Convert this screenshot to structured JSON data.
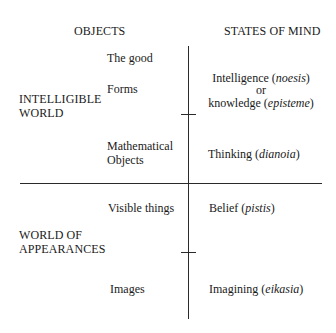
{
  "headers": {
    "objects": "OBJECTS",
    "states_of_mind": "STATES OF MIND"
  },
  "realms": {
    "intelligible": [
      "INTELLIGIBLE",
      "WORLD"
    ],
    "appearances": [
      "WORLD OF",
      "APPEARANCES"
    ]
  },
  "objects": {
    "the_good": "The good",
    "forms": "Forms",
    "mathematical": [
      "Mathematical",
      "Objects"
    ],
    "visible_things": "Visible things",
    "images": "Images"
  },
  "states": {
    "intelligence": {
      "term": "Intelligence (",
      "greek": "noesis",
      "close": ")"
    },
    "or": "or",
    "knowledge": {
      "term": "knowledge (",
      "greek": "episteme",
      "close": ")"
    },
    "thinking": {
      "term": "Thinking (",
      "greek": "dianoia",
      "close": ")"
    },
    "belief": {
      "term": "Belief (",
      "greek": "pistis",
      "close": ")"
    },
    "imagining": {
      "term": "Imagining (",
      "greek": "eikasia",
      "close": ")"
    }
  },
  "lines": {
    "color": "#2a2a2a",
    "vertical_x": 188,
    "horizontal_y": 183,
    "ticks_y": [
      114,
      252
    ]
  }
}
